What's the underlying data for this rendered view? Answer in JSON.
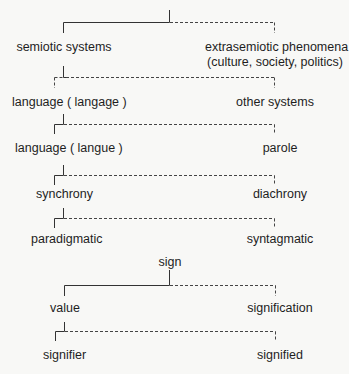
{
  "diagram": {
    "type": "binary dichotomy tree",
    "levels": [
      {
        "left": "semiotic systems",
        "right_line1": "extrasemiotic phenomena",
        "right_line2": "(culture, society, politics)"
      },
      {
        "left": "language ( langage )",
        "right": "other systems"
      },
      {
        "left": "language ( langue )",
        "right": "parole"
      },
      {
        "left": "synchrony",
        "right": "diachrony"
      },
      {
        "left": "paradigmatic",
        "right": "syntagmatic"
      }
    ],
    "sign_tree": {
      "root": "sign",
      "level1": {
        "left": "value",
        "right": "signification"
      },
      "level2": {
        "left": "signifier",
        "right": "signified"
      }
    },
    "legend": {
      "solid": "selected branch",
      "dashed": "excluded branch"
    }
  }
}
